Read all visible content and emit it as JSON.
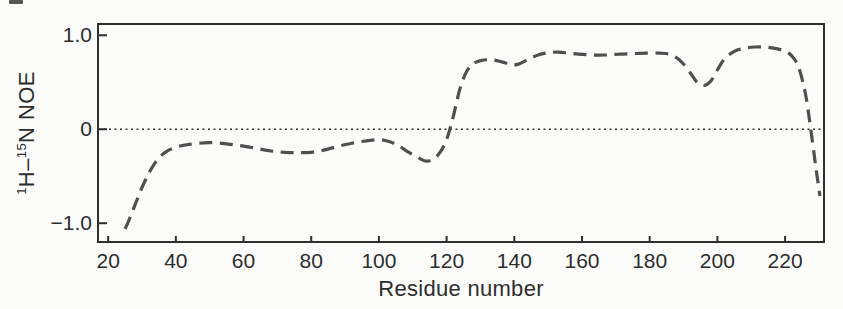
{
  "figure": {
    "kind": "scanned scientific line chart",
    "background": "#fcfcfb"
  },
  "stray_mark": {
    "color": "#555555"
  },
  "chart_data": {
    "type": "line",
    "title": "",
    "xlabel": "Residue number",
    "ylabel_plain": "1H-15N NOE",
    "ylabel": {
      "sup1": "1",
      "mid": "H–",
      "sup2": "15",
      "end": "N NOE"
    },
    "x_ticks": [
      20,
      40,
      60,
      80,
      100,
      120,
      140,
      160,
      180,
      200,
      220
    ],
    "y_ticks": [
      {
        "value": 1.0,
        "label": "1.0"
      },
      {
        "value": 0.0,
        "label": "0"
      },
      {
        "value": -1.0,
        "label": "−1.0"
      }
    ],
    "xlim": [
      17,
      231.5
    ],
    "ylim": [
      -1.2,
      1.12
    ],
    "grid": false,
    "reference_line": {
      "y": 0,
      "style": "dotted"
    },
    "series": [
      {
        "name": "1H-15N NOE",
        "style": "dashed",
        "color": "#4f4f4f",
        "points": [
          [
            25,
            -1.06
          ],
          [
            26,
            -0.98
          ],
          [
            28,
            -0.8
          ],
          [
            30,
            -0.62
          ],
          [
            32,
            -0.47
          ],
          [
            34,
            -0.35
          ],
          [
            36,
            -0.27
          ],
          [
            38,
            -0.22
          ],
          [
            41,
            -0.18
          ],
          [
            44,
            -0.16
          ],
          [
            48,
            -0.145
          ],
          [
            52,
            -0.145
          ],
          [
            56,
            -0.16
          ],
          [
            60,
            -0.18
          ],
          [
            64,
            -0.205
          ],
          [
            68,
            -0.23
          ],
          [
            72,
            -0.245
          ],
          [
            76,
            -0.25
          ],
          [
            80,
            -0.245
          ],
          [
            84,
            -0.22
          ],
          [
            88,
            -0.18
          ],
          [
            92,
            -0.15
          ],
          [
            96,
            -0.125
          ],
          [
            100,
            -0.11
          ],
          [
            103,
            -0.13
          ],
          [
            106,
            -0.18
          ],
          [
            109,
            -0.25
          ],
          [
            112,
            -0.31
          ],
          [
            114,
            -0.34
          ],
          [
            116,
            -0.32
          ],
          [
            118,
            -0.25
          ],
          [
            120,
            -0.11
          ],
          [
            122,
            0.14
          ],
          [
            124,
            0.44
          ],
          [
            126,
            0.62
          ],
          [
            128,
            0.7
          ],
          [
            130,
            0.73
          ],
          [
            133,
            0.74
          ],
          [
            136,
            0.72
          ],
          [
            139,
            0.69
          ],
          [
            141,
            0.69
          ],
          [
            144,
            0.74
          ],
          [
            147,
            0.79
          ],
          [
            150,
            0.815
          ],
          [
            153,
            0.82
          ],
          [
            156,
            0.81
          ],
          [
            159,
            0.8
          ],
          [
            163,
            0.79
          ],
          [
            167,
            0.79
          ],
          [
            171,
            0.8
          ],
          [
            175,
            0.805
          ],
          [
            179,
            0.81
          ],
          [
            183,
            0.81
          ],
          [
            186,
            0.795
          ],
          [
            189,
            0.73
          ],
          [
            192,
            0.6
          ],
          [
            194,
            0.5
          ],
          [
            196,
            0.465
          ],
          [
            198,
            0.51
          ],
          [
            200,
            0.63
          ],
          [
            202,
            0.745
          ],
          [
            205,
            0.83
          ],
          [
            208,
            0.86
          ],
          [
            211,
            0.875
          ],
          [
            214,
            0.875
          ],
          [
            217,
            0.86
          ],
          [
            220,
            0.83
          ],
          [
            222,
            0.78
          ],
          [
            224,
            0.66
          ],
          [
            226,
            0.38
          ],
          [
            227.5,
            0.02
          ],
          [
            229,
            -0.38
          ],
          [
            230.3,
            -0.71
          ]
        ]
      }
    ],
    "colors": {
      "axis": "#2f2f2f",
      "text": "#2d2d2d",
      "curve": "#4f4f4f",
      "zero_line": "#2f2f2f",
      "background": "#fcfcfb"
    }
  }
}
